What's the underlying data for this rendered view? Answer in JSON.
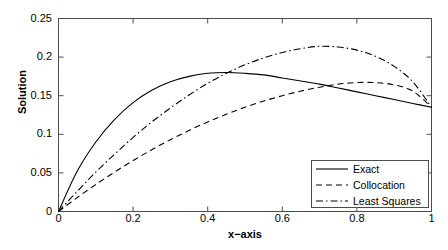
{
  "chart_data": {
    "type": "line",
    "title": "",
    "xlabel": "x−axis",
    "ylabel": "Solution",
    "xlim": [
      0,
      1
    ],
    "ylim": [
      0,
      0.25
    ],
    "grid": false,
    "xticks": [
      "0",
      "0.2",
      "0.4",
      "0.6",
      "0.8",
      "1"
    ],
    "xtick_values": [
      0,
      0.2,
      0.4,
      0.6,
      0.8,
      1
    ],
    "yticks": [
      "0",
      "0.05",
      "0.1",
      "0.15",
      "0.2",
      "0.25"
    ],
    "ytick_values": [
      0,
      0.05,
      0.1,
      0.15,
      0.2,
      0.25
    ],
    "legend_position": "lower-right",
    "x": [
      0,
      0.05,
      0.1,
      0.15,
      0.2,
      0.25,
      0.3,
      0.35,
      0.4,
      0.45,
      0.5,
      0.55,
      0.6,
      0.65,
      0.7,
      0.75,
      0.8,
      0.85,
      0.9,
      0.95,
      1
    ],
    "series": [
      {
        "name": "Exact",
        "style": "solid",
        "color": "#000000",
        "values": [
          0.0,
          0.052,
          0.09,
          0.119,
          0.141,
          0.157,
          0.168,
          0.175,
          0.179,
          0.18,
          0.179,
          0.177,
          0.173,
          0.169,
          0.165,
          0.16,
          0.155,
          0.15,
          0.145,
          0.14,
          0.135
        ]
      },
      {
        "name": "Collocation",
        "style": "dashed",
        "color": "#000000",
        "values": [
          0.0,
          0.018,
          0.035,
          0.051,
          0.066,
          0.08,
          0.093,
          0.105,
          0.116,
          0.126,
          0.135,
          0.143,
          0.15,
          0.156,
          0.161,
          0.165,
          0.167,
          0.167,
          0.164,
          0.156,
          0.135
        ]
      },
      {
        "name": "Least Squares",
        "style": "dashdot",
        "color": "#000000",
        "values": [
          0.0,
          0.026,
          0.051,
          0.074,
          0.096,
          0.116,
          0.134,
          0.151,
          0.166,
          0.179,
          0.19,
          0.199,
          0.206,
          0.211,
          0.214,
          0.213,
          0.209,
          0.201,
          0.188,
          0.168,
          0.135
        ]
      }
    ],
    "peaks": {
      "exact": {
        "x": 0.45,
        "y": 0.18
      },
      "collocation": {
        "x": 0.82,
        "y": 0.168
      },
      "least_squares": {
        "x": 0.7,
        "y": 0.214
      }
    },
    "endpoint_value": 0.135
  },
  "axes": {
    "frame_color": "#4d4d4d",
    "line_color": "#000000"
  },
  "legend": {
    "entries": [
      {
        "label": "Exact",
        "style": "solid"
      },
      {
        "label": "Collocation",
        "style": "dashed"
      },
      {
        "label": "Least Squares",
        "style": "dashdot"
      }
    ]
  }
}
